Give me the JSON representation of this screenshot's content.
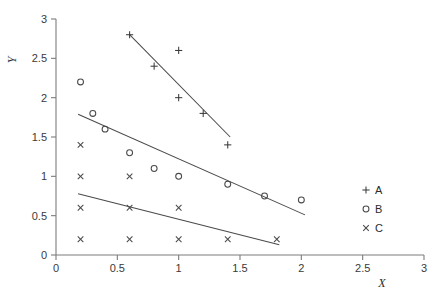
{
  "chart_data": {
    "type": "scatter",
    "title": "",
    "xlabel": "X",
    "ylabel": "Y",
    "xlim": [
      0,
      3
    ],
    "ylim": [
      0,
      3
    ],
    "xticks": [
      "0",
      "0.5",
      "1",
      "1.5",
      "2",
      "2.5",
      "3"
    ],
    "xtick_values": [
      0,
      0.5,
      1,
      1.5,
      2,
      2.5,
      3
    ],
    "yticks": [
      "0",
      "0.5",
      "1",
      "1.5",
      "2",
      "2.5",
      "3"
    ],
    "ytick_values": [
      0,
      0.5,
      1,
      1.5,
      2,
      2.5,
      3
    ],
    "grid": false,
    "legend_position": "right",
    "series": [
      {
        "name": "A",
        "marker": "plus",
        "points": [
          {
            "x": 0.6,
            "y": 2.8
          },
          {
            "x": 0.8,
            "y": 2.4
          },
          {
            "x": 1.0,
            "y": 2.6
          },
          {
            "x": 1.0,
            "y": 2.0
          },
          {
            "x": 1.2,
            "y": 1.8
          },
          {
            "x": 1.4,
            "y": 1.4
          }
        ],
        "trendline": {
          "x1": 0.6,
          "y1": 2.8,
          "x2": 1.42,
          "y2": 1.5
        }
      },
      {
        "name": "B",
        "marker": "circle",
        "points": [
          {
            "x": 0.2,
            "y": 2.2
          },
          {
            "x": 0.3,
            "y": 1.8
          },
          {
            "x": 0.4,
            "y": 1.6
          },
          {
            "x": 0.6,
            "y": 1.3
          },
          {
            "x": 0.8,
            "y": 1.1
          },
          {
            "x": 1.0,
            "y": 1.0
          },
          {
            "x": 1.4,
            "y": 0.9
          },
          {
            "x": 1.7,
            "y": 0.75
          },
          {
            "x": 2.0,
            "y": 0.7
          }
        ],
        "trendline": {
          "x1": 0.18,
          "y1": 1.79,
          "x2": 2.03,
          "y2": 0.51
        }
      },
      {
        "name": "C",
        "marker": "cross",
        "points": [
          {
            "x": 0.2,
            "y": 1.4
          },
          {
            "x": 0.2,
            "y": 1.0
          },
          {
            "x": 0.2,
            "y": 0.6
          },
          {
            "x": 0.2,
            "y": 0.2
          },
          {
            "x": 0.6,
            "y": 1.0
          },
          {
            "x": 0.6,
            "y": 0.6
          },
          {
            "x": 0.6,
            "y": 0.2
          },
          {
            "x": 1.0,
            "y": 0.6
          },
          {
            "x": 1.0,
            "y": 0.2
          },
          {
            "x": 1.4,
            "y": 0.2
          },
          {
            "x": 1.8,
            "y": 0.2
          }
        ],
        "trendline": {
          "x1": 0.18,
          "y1": 0.78,
          "x2": 1.82,
          "y2": 0.13
        }
      }
    ],
    "legend": [
      {
        "label": "A",
        "marker": "plus"
      },
      {
        "label": "B",
        "marker": "circle"
      },
      {
        "label": "C",
        "marker": "cross"
      }
    ]
  },
  "axes": {
    "x_title": "X",
    "y_title": "Y"
  }
}
